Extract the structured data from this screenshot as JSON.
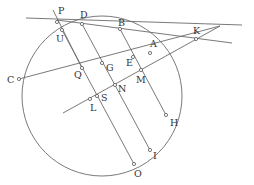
{
  "diagram": {
    "type": "geometry",
    "circle": {
      "cx": 102,
      "cy": 96,
      "r": 80
    },
    "points": [
      {
        "name": "P",
        "x": 57,
        "y": 22,
        "lx": 58,
        "ly": 14
      },
      {
        "name": "U",
        "x": 62,
        "y": 30,
        "lx": 56,
        "ly": 42
      },
      {
        "name": "D",
        "x": 82,
        "y": 24,
        "lx": 80,
        "ly": 18
      },
      {
        "name": "B",
        "x": 120,
        "y": 29,
        "lx": 118,
        "ly": 26
      },
      {
        "name": "K",
        "x": 196,
        "y": 39,
        "lx": 193,
        "ly": 34
      },
      {
        "name": "A",
        "x": 150,
        "y": 53,
        "lx": 150,
        "ly": 47
      },
      {
        "name": "E",
        "x": 133,
        "y": 57,
        "lx": 126,
        "ly": 66
      },
      {
        "name": "G",
        "x": 102,
        "y": 63,
        "lx": 106,
        "ly": 71
      },
      {
        "name": "Q",
        "x": 82,
        "y": 68,
        "lx": 74,
        "ly": 78
      },
      {
        "name": "C",
        "x": 19,
        "y": 79,
        "lx": 7,
        "ly": 83
      },
      {
        "name": "M",
        "x": 141,
        "y": 70,
        "lx": 136,
        "ly": 83
      },
      {
        "name": "N",
        "x": 115,
        "y": 85,
        "lx": 118,
        "ly": 92
      },
      {
        "name": "S",
        "x": 97,
        "y": 96,
        "lx": 101,
        "ly": 101
      },
      {
        "name": "L",
        "x": 90,
        "y": 99,
        "lx": 90,
        "ly": 111
      },
      {
        "name": "H",
        "x": 166,
        "y": 115,
        "lx": 170,
        "ly": 126
      },
      {
        "name": "I",
        "x": 150,
        "y": 150,
        "lx": 153,
        "ly": 159
      },
      {
        "name": "O",
        "x": 134,
        "y": 164,
        "lx": 134,
        "ly": 177
      }
    ],
    "segments": [
      {
        "id": "line-P-K",
        "x1": 26,
        "y1": 18,
        "x2": 242,
        "y2": 25
      },
      {
        "id": "line-B-K",
        "x1": 57,
        "y1": 20,
        "x2": 232,
        "y2": 43
      },
      {
        "id": "line-C-K",
        "x1": 19,
        "y1": 79,
        "x2": 220,
        "y2": 26
      },
      {
        "id": "line-L-K",
        "x1": 63,
        "y1": 113,
        "x2": 220,
        "y2": 26
      },
      {
        "id": "line-P-U",
        "x1": 53,
        "y1": 10,
        "x2": 82,
        "y2": 68
      },
      {
        "id": "line-U-O",
        "x1": 62,
        "y1": 30,
        "x2": 134,
        "y2": 164
      },
      {
        "id": "line-D-I",
        "x1": 82,
        "y1": 24,
        "x2": 150,
        "y2": 150
      },
      {
        "id": "line-B-H",
        "x1": 120,
        "y1": 29,
        "x2": 166,
        "y2": 115
      }
    ]
  }
}
